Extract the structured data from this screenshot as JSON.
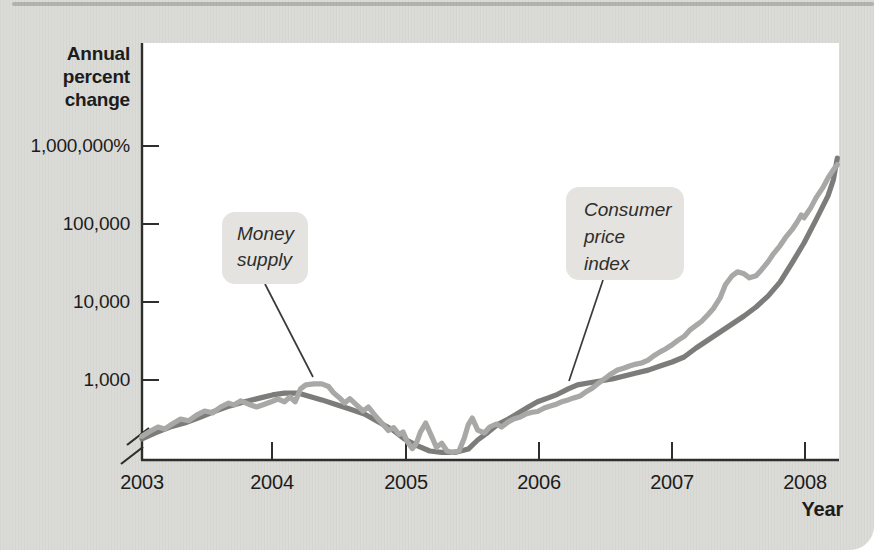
{
  "figure": {
    "y_axis_title_lines": [
      "Annual",
      "percent",
      "change"
    ],
    "x_axis_title": "Year",
    "y_tick_labels": [
      "1,000,000%",
      "100,000",
      "10,000",
      "1,000"
    ],
    "x_tick_labels": [
      "2003",
      "2004",
      "2005",
      "2006",
      "2007",
      "2008"
    ],
    "annotations": {
      "money_supply": {
        "line1": "Money",
        "line2": "supply"
      },
      "cpi": {
        "line1": "Consumer",
        "line2": "price",
        "line3": "index"
      }
    },
    "colors": {
      "background": "#dadad6",
      "plot_background": "#ffffff",
      "axis": "#2e2e2c",
      "annotation_box": "#e4e3df",
      "leader_line": "#3a3a38",
      "text": "#1c1c1c"
    }
  },
  "chart_data": {
    "type": "line",
    "title": "",
    "xlabel": "Year",
    "ylabel": "Annual percent change",
    "x_scale": "linear",
    "y_scale": "log",
    "xlim": [
      2003,
      2008.25
    ],
    "ylim": [
      100,
      1000000
    ],
    "x_ticks": [
      2003,
      2004,
      2005,
      2006,
      2007,
      2008
    ],
    "y_ticks": [
      1000,
      10000,
      100000,
      1000000
    ],
    "grid": false,
    "legend": "inline-annotations",
    "axis_break_below_y": 1000,
    "series": [
      {
        "key": "cpi",
        "name": "Consumer price index",
        "color": "#7c7c7a",
        "points": [
          [
            2003.0,
            175
          ],
          [
            2003.1,
            210
          ],
          [
            2003.21,
            250
          ],
          [
            2003.32,
            280
          ],
          [
            2003.44,
            335
          ],
          [
            2003.55,
            400
          ],
          [
            2003.66,
            465
          ],
          [
            2003.77,
            525
          ],
          [
            2003.89,
            590
          ],
          [
            2003.98,
            645
          ],
          [
            2004.07,
            680
          ],
          [
            2004.17,
            680
          ],
          [
            2004.26,
            615
          ],
          [
            2004.35,
            555
          ],
          [
            2004.45,
            490
          ],
          [
            2004.56,
            425
          ],
          [
            2004.67,
            365
          ],
          [
            2004.79,
            280
          ],
          [
            2004.88,
            230
          ],
          [
            2004.97,
            175
          ],
          [
            2005.07,
            143
          ],
          [
            2005.16,
            123
          ],
          [
            2005.25,
            118
          ],
          [
            2005.35,
            118
          ],
          [
            2005.45,
            130
          ],
          [
            2005.52,
            170
          ],
          [
            2005.6,
            215
          ],
          [
            2005.67,
            268
          ],
          [
            2005.75,
            316
          ],
          [
            2005.82,
            373
          ],
          [
            2005.9,
            450
          ],
          [
            2005.97,
            525
          ],
          [
            2006.05,
            590
          ],
          [
            2006.12,
            655
          ],
          [
            2006.2,
            770
          ],
          [
            2006.27,
            865
          ],
          [
            2006.35,
            915
          ],
          [
            2006.44,
            970
          ],
          [
            2006.53,
            1030
          ],
          [
            2006.62,
            1130
          ],
          [
            2006.71,
            1230
          ],
          [
            2006.8,
            1340
          ],
          [
            2006.89,
            1510
          ],
          [
            2006.98,
            1700
          ],
          [
            2007.07,
            1970
          ],
          [
            2007.16,
            2570
          ],
          [
            2007.25,
            3260
          ],
          [
            2007.34,
            4120
          ],
          [
            2007.43,
            5220
          ],
          [
            2007.52,
            6620
          ],
          [
            2007.61,
            8630
          ],
          [
            2007.7,
            11900
          ],
          [
            2007.79,
            18000
          ],
          [
            2007.88,
            31600
          ],
          [
            2007.97,
            57000
          ],
          [
            2008.06,
            113000
          ],
          [
            2008.15,
            229000
          ],
          [
            2008.19,
            367000
          ],
          [
            2008.22,
            700000
          ]
        ]
      },
      {
        "key": "money_supply",
        "name": "Money supply",
        "color": "#a8a8a6",
        "points": [
          [
            2003.0,
            190
          ],
          [
            2003.06,
            220
          ],
          [
            2003.12,
            250
          ],
          [
            2003.17,
            235
          ],
          [
            2003.23,
            275
          ],
          [
            2003.29,
            315
          ],
          [
            2003.35,
            300
          ],
          [
            2003.41,
            355
          ],
          [
            2003.47,
            400
          ],
          [
            2003.53,
            380
          ],
          [
            2003.59,
            450
          ],
          [
            2003.65,
            505
          ],
          [
            2003.69,
            480
          ],
          [
            2003.74,
            540
          ],
          [
            2003.8,
            490
          ],
          [
            2003.86,
            450
          ],
          [
            2003.92,
            490
          ],
          [
            2003.97,
            525
          ],
          [
            2004.02,
            570
          ],
          [
            2004.07,
            525
          ],
          [
            2004.11,
            605
          ],
          [
            2004.15,
            525
          ],
          [
            2004.19,
            770
          ],
          [
            2004.23,
            865
          ],
          [
            2004.29,
            890
          ],
          [
            2004.35,
            890
          ],
          [
            2004.4,
            825
          ],
          [
            2004.44,
            680
          ],
          [
            2004.49,
            575
          ],
          [
            2004.52,
            505
          ],
          [
            2004.56,
            575
          ],
          [
            2004.61,
            480
          ],
          [
            2004.66,
            400
          ],
          [
            2004.7,
            450
          ],
          [
            2004.76,
            335
          ],
          [
            2004.81,
            270
          ],
          [
            2004.85,
            225
          ],
          [
            2004.89,
            245
          ],
          [
            2004.93,
            200
          ],
          [
            2004.96,
            215
          ],
          [
            2004.99,
            163
          ],
          [
            2005.03,
            132
          ],
          [
            2005.06,
            155
          ],
          [
            2005.09,
            215
          ],
          [
            2005.13,
            280
          ],
          [
            2005.18,
            180
          ],
          [
            2005.21,
            137
          ],
          [
            2005.25,
            155
          ],
          [
            2005.29,
            123
          ],
          [
            2005.33,
            118
          ],
          [
            2005.38,
            123
          ],
          [
            2005.42,
            180
          ],
          [
            2005.45,
            268
          ],
          [
            2005.48,
            325
          ],
          [
            2005.52,
            228
          ],
          [
            2005.57,
            210
          ],
          [
            2005.61,
            250
          ],
          [
            2005.66,
            273
          ],
          [
            2005.7,
            250
          ],
          [
            2005.75,
            290
          ],
          [
            2005.79,
            316
          ],
          [
            2005.84,
            335
          ],
          [
            2005.88,
            365
          ],
          [
            2005.93,
            385
          ],
          [
            2005.97,
            395
          ],
          [
            2006.02,
            437
          ],
          [
            2006.06,
            460
          ],
          [
            2006.11,
            490
          ],
          [
            2006.15,
            525
          ],
          [
            2006.2,
            555
          ],
          [
            2006.24,
            590
          ],
          [
            2006.29,
            625
          ],
          [
            2006.33,
            700
          ],
          [
            2006.38,
            785
          ],
          [
            2006.42,
            890
          ],
          [
            2006.47,
            1030
          ],
          [
            2006.51,
            1160
          ],
          [
            2006.57,
            1345
          ],
          [
            2006.62,
            1425
          ],
          [
            2006.66,
            1510
          ],
          [
            2006.71,
            1600
          ],
          [
            2006.75,
            1650
          ],
          [
            2006.8,
            1800
          ],
          [
            2006.84,
            2030
          ],
          [
            2006.89,
            2290
          ],
          [
            2006.93,
            2500
          ],
          [
            2006.98,
            2830
          ],
          [
            2007.02,
            3200
          ],
          [
            2007.07,
            3620
          ],
          [
            2007.11,
            4330
          ],
          [
            2007.16,
            5010
          ],
          [
            2007.2,
            5620
          ],
          [
            2007.25,
            6920
          ],
          [
            2007.29,
            8250
          ],
          [
            2007.34,
            11300
          ],
          [
            2007.38,
            16600
          ],
          [
            2007.43,
            21700
          ],
          [
            2007.47,
            24400
          ],
          [
            2007.52,
            23000
          ],
          [
            2007.56,
            20400
          ],
          [
            2007.61,
            21700
          ],
          [
            2007.65,
            25800
          ],
          [
            2007.7,
            32700
          ],
          [
            2007.74,
            41500
          ],
          [
            2007.79,
            52600
          ],
          [
            2007.83,
            66700
          ],
          [
            2007.88,
            84600
          ],
          [
            2007.92,
            107000
          ],
          [
            2007.95,
            131000
          ],
          [
            2007.97,
            120000
          ],
          [
            2008.02,
            161000
          ],
          [
            2008.06,
            216000
          ],
          [
            2008.11,
            290000
          ],
          [
            2008.15,
            389000
          ],
          [
            2008.19,
            495000
          ],
          [
            2008.22,
            577000
          ]
        ]
      }
    ]
  }
}
